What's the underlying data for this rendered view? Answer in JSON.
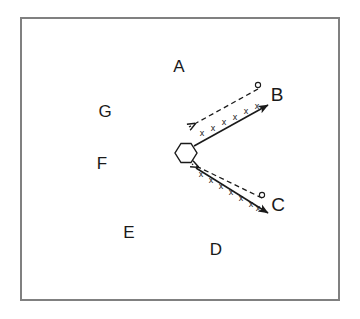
{
  "figure": {
    "background_color": "#ffffff",
    "frame": {
      "name": "outer-frame",
      "x": 20,
      "y": 17,
      "width": 320,
      "height": 284,
      "stroke_color": "#808080",
      "stroke_width": 2,
      "fill": "#ffffff"
    },
    "stroke_color": "#1a1a1a",
    "region_labels": [
      {
        "text": "A",
        "x": 179,
        "y": 68
      },
      {
        "text": "B",
        "x": 277,
        "y": 96
      },
      {
        "text": "C",
        "x": 278,
        "y": 206
      },
      {
        "text": "D",
        "x": 216,
        "y": 251
      },
      {
        "text": "E",
        "x": 129,
        "y": 234
      },
      {
        "text": "F",
        "x": 102,
        "y": 165
      },
      {
        "text": "G",
        "x": 105,
        "y": 113
      }
    ],
    "hexagon": {
      "name": "hexagon-marker",
      "center_x": 186,
      "center_y": 153,
      "radius": 11,
      "orientation": "flat-top",
      "fill": "#ffffff",
      "stroke_width": 1.4
    },
    "paths": [
      {
        "name": "upper-path",
        "target_label": "B",
        "solid_arrow": {
          "from_x": 194,
          "from_y": 146,
          "to_x": 268,
          "to_y": 105,
          "style": "solid",
          "direction": "outward"
        },
        "dashed_arrow": {
          "from_x": 258,
          "from_y": 89,
          "to_x": 189,
          "to_y": 127,
          "style": "dashed",
          "direction": "inward"
        },
        "circle_marker": {
          "x": 258,
          "y": 86,
          "radius": 2.6
        },
        "x_mark_count": 6,
        "x_marks": [
          {
            "x": 202,
            "y": 134
          },
          {
            "x": 213,
            "y": 129
          },
          {
            "x": 224,
            "y": 123
          },
          {
            "x": 235,
            "y": 118
          },
          {
            "x": 246,
            "y": 112
          },
          {
            "x": 257,
            "y": 107
          }
        ]
      },
      {
        "name": "lower-path",
        "target_label": "C",
        "solid_arrow": {
          "from_x": 196,
          "from_y": 168,
          "to_x": 268,
          "to_y": 213,
          "style": "solid",
          "direction": "outward"
        },
        "dashed_arrow": {
          "from_x": 262,
          "from_y": 198,
          "to_x": 192,
          "to_y": 164,
          "style": "dashed",
          "direction": "inward"
        },
        "circle_marker": {
          "x": 262,
          "y": 196,
          "radius": 2.6
        },
        "x_mark_count": 7,
        "x_marks": [
          {
            "x": 201,
            "y": 175
          },
          {
            "x": 211,
            "y": 181
          },
          {
            "x": 221,
            "y": 187
          },
          {
            "x": 231,
            "y": 193
          },
          {
            "x": 241,
            "y": 199
          },
          {
            "x": 251,
            "y": 205
          },
          {
            "x": 258,
            "y": 209
          }
        ]
      }
    ]
  }
}
